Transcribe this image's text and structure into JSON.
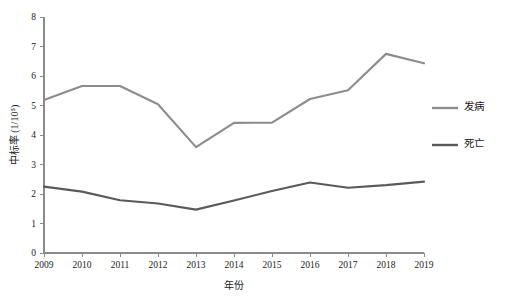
{
  "chart_data": {
    "type": "line",
    "title": "",
    "xlabel": "年份",
    "ylabel": "中标率 (1/10⁵)",
    "categories": [
      "2009",
      "2010",
      "2011",
      "2012",
      "2013",
      "2014",
      "2015",
      "2016",
      "2017",
      "2018",
      "2019"
    ],
    "x": [
      2009,
      2010,
      2011,
      2012,
      2013,
      2014,
      2015,
      2016,
      2017,
      2018,
      2019
    ],
    "xlim": [
      2009,
      2019
    ],
    "ylim": [
      0,
      8
    ],
    "y_ticks": [
      "0",
      "1",
      "2",
      "3",
      "4",
      "5",
      "6",
      "7",
      "8"
    ],
    "y_tick_values": [
      0,
      1,
      2,
      3,
      4,
      5,
      6,
      7,
      8
    ],
    "grid": false,
    "legend_position": "right",
    "series": [
      {
        "name": "发病",
        "color": "#8c8c8c",
        "values": [
          5.19,
          5.66,
          5.66,
          5.04,
          3.59,
          4.41,
          4.42,
          5.22,
          5.52,
          6.75,
          6.43
        ]
      },
      {
        "name": "死亡",
        "color": "#5a5a5a",
        "values": [
          2.25,
          2.08,
          1.79,
          1.68,
          1.47,
          1.78,
          2.1,
          2.39,
          2.21,
          2.3,
          2.42
        ]
      }
    ]
  },
  "legend": {
    "items": [
      {
        "label": "发病",
        "color": "#8c8c8c"
      },
      {
        "label": "死亡",
        "color": "#5a5a5a"
      }
    ]
  },
  "axes": {
    "y_axis_title": "中标率 (1/10⁵)",
    "x_axis_title": "年份"
  }
}
